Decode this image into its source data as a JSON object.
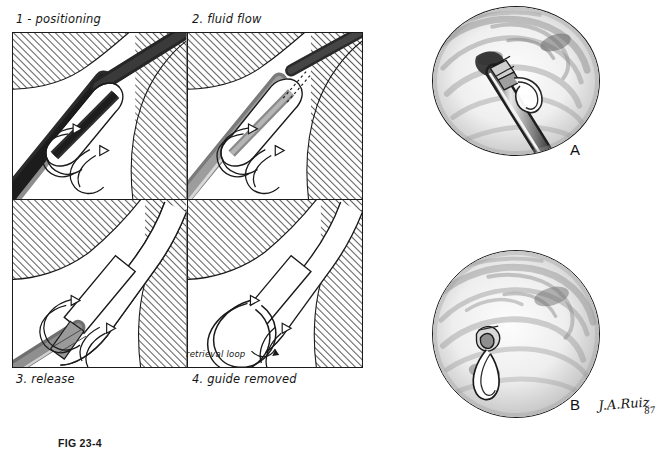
{
  "figure": {
    "caption": "FIG 23-4",
    "signature_artist": "J.A.Ruiz",
    "signature_year": "87"
  },
  "panels": [
    {
      "id": "1",
      "title": "1 - positioning"
    },
    {
      "id": "2",
      "title": "2. fluid flow"
    },
    {
      "id": "3",
      "title": "3. release"
    },
    {
      "id": "4",
      "title": "4. guide removed"
    }
  ],
  "annotations": {
    "retrieval_loop": "retrieval loop"
  },
  "scope_views": [
    {
      "id": "A",
      "label": "A"
    },
    {
      "id": "B",
      "label": "B"
    }
  ],
  "colors": {
    "ink": "#1a1a1a",
    "hatch": "#6d6d6d",
    "tissue_fill": "#ffffff",
    "guide_dark": "#2b2b2b",
    "guide_mid": "#8c8c8c",
    "guide_light": "#cfcfcf",
    "stent_band": "#9a9a9a"
  }
}
